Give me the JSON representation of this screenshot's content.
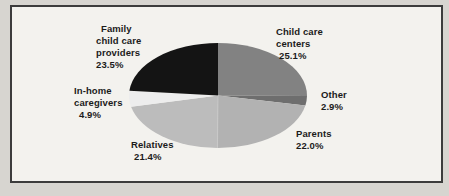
{
  "figure": {
    "background_color": "#d7d5d0",
    "panel_color": "#f3f2ee",
    "panel_border_color": "#3c3c3c",
    "text_color": "#1b1b1b"
  },
  "chart_data": {
    "type": "pie",
    "title": "",
    "legend_position": "none",
    "direction": "clockwise",
    "start_angle": "12 o'clock",
    "slices": [
      {
        "label": "Child care centers",
        "value": 25.1,
        "display": "25.1%",
        "color": "#828282"
      },
      {
        "label": "Other",
        "value": 2.9,
        "display": "2.9%",
        "color": "#6e6e6e"
      },
      {
        "label": "Parents",
        "value": 22.0,
        "display": "22.0%",
        "color": "#b2b2b2"
      },
      {
        "label": "Relatives",
        "value": 21.4,
        "display": "21.4%",
        "color": "#bcbcbc"
      },
      {
        "label": "In-home caregivers",
        "value": 4.9,
        "display": "4.9%",
        "color": "#ededed"
      },
      {
        "label": "Family child care providers",
        "value": 23.5,
        "display": "23.5%",
        "color": "#141414"
      }
    ]
  },
  "labels": {
    "family": {
      "lines": [
        "Family",
        "child care",
        "providers",
        "23.5%"
      ]
    },
    "centers": {
      "lines": [
        "Child care",
        "centers",
        "25.1%"
      ]
    },
    "other": {
      "lines": [
        "Other",
        "2.9%"
      ]
    },
    "parents": {
      "lines": [
        "Parents",
        "22.0%"
      ]
    },
    "relatives": {
      "lines": [
        "Relatives",
        "21.4%"
      ]
    },
    "inhome": {
      "lines": [
        "In-home",
        "caregivers",
        "4.9%"
      ]
    }
  }
}
